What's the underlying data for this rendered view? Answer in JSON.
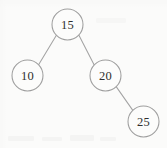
{
  "figure": {
    "kind": "binary-search-tree",
    "background_color": "#fbfbfa",
    "stroke_color": "#9e9e9e",
    "label_color": "#2e2e2e",
    "node_radius": 15.5
  },
  "nodes": [
    {
      "id": "root",
      "label": "15",
      "cx": 67.5,
      "cy": 24.5,
      "role": "root"
    },
    {
      "id": "left-child",
      "label": "10",
      "cx": 27.5,
      "cy": 75.5,
      "role": "left-child-of-root"
    },
    {
      "id": "right-child",
      "label": "20",
      "cx": 105.5,
      "cy": 75.5,
      "role": "right-child-of-root"
    },
    {
      "id": "grandchild",
      "label": "25",
      "cx": 143.5,
      "cy": 121.5,
      "role": "right-child-of-20"
    }
  ],
  "edges": [
    {
      "id": "edge-15-10",
      "from": "15",
      "to": "10",
      "x1": 56.4,
      "y1": 35.3,
      "x2": 38.6,
      "y2": 64.7
    },
    {
      "id": "edge-15-20",
      "from": "15",
      "to": "20",
      "x1": 78.8,
      "y1": 35.0,
      "x2": 94.2,
      "y2": 65.0
    },
    {
      "id": "edge-20-25",
      "from": "20",
      "to": "25",
      "x1": 116.0,
      "y1": 86.4,
      "x2": 133.0,
      "y2": 110.6
    }
  ]
}
